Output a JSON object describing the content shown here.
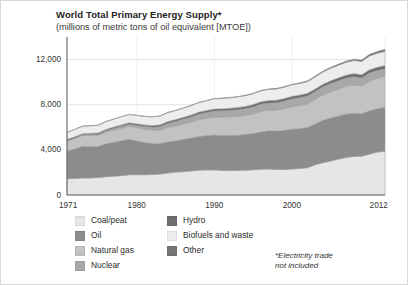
{
  "chart_data": {
    "type": "area",
    "stacked": true,
    "title": "World Total Primary Energy Supply*",
    "subtitle": "(millions of metric tons of oil equivalent [MTOE])",
    "xlabel": "",
    "ylabel": "",
    "grid": true,
    "legend_position": "below",
    "xlim": [
      1971,
      2012
    ],
    "ylim": [
      0,
      14000
    ],
    "yticks": [
      0,
      4000,
      8000,
      12000
    ],
    "ytick_labels": [
      "0",
      "4,000",
      "8,000",
      "12,000"
    ],
    "xticks": [
      1971,
      1980,
      1990,
      2000,
      2012
    ],
    "xtick_labels": [
      "1971",
      "1980",
      "1990",
      "2000",
      "2012"
    ],
    "x": [
      1971,
      1972,
      1973,
      1974,
      1975,
      1976,
      1977,
      1978,
      1979,
      1980,
      1981,
      1982,
      1983,
      1984,
      1985,
      1986,
      1987,
      1988,
      1989,
      1990,
      1991,
      1992,
      1993,
      1994,
      1995,
      1996,
      1997,
      1998,
      1999,
      2000,
      2001,
      2002,
      2003,
      2004,
      2005,
      2006,
      2007,
      2008,
      2009,
      2010,
      2011,
      2012
    ],
    "series": [
      {
        "name": "Coal/peat",
        "color": "#e6e6e6",
        "values": [
          1440,
          1470,
          1500,
          1510,
          1550,
          1620,
          1670,
          1710,
          1790,
          1800,
          1790,
          1810,
          1850,
          1950,
          2030,
          2070,
          2130,
          2190,
          2220,
          2220,
          2180,
          2160,
          2180,
          2190,
          2230,
          2280,
          2300,
          2270,
          2250,
          2300,
          2350,
          2420,
          2680,
          2860,
          3020,
          3180,
          3320,
          3420,
          3440,
          3620,
          3800,
          3880
        ]
      },
      {
        "name": "Oil",
        "color": "#8c8c8c",
        "values": [
          2450,
          2620,
          2810,
          2790,
          2740,
          2920,
          3010,
          3100,
          3140,
          3000,
          2860,
          2760,
          2720,
          2760,
          2760,
          2860,
          2910,
          3000,
          3050,
          3090,
          3090,
          3130,
          3120,
          3180,
          3230,
          3300,
          3390,
          3400,
          3480,
          3530,
          3540,
          3560,
          3630,
          3760,
          3810,
          3830,
          3860,
          3830,
          3760,
          3840,
          3850,
          3880
        ]
      },
      {
        "name": "Natural gas",
        "color": "#c2c2c2",
        "values": [
          890,
          930,
          970,
          990,
          990,
          1040,
          1070,
          1110,
          1170,
          1180,
          1190,
          1190,
          1200,
          1290,
          1330,
          1360,
          1430,
          1490,
          1550,
          1600,
          1640,
          1650,
          1680,
          1690,
          1740,
          1830,
          1830,
          1870,
          1920,
          2010,
          2050,
          2110,
          2180,
          2250,
          2330,
          2390,
          2470,
          2520,
          2470,
          2630,
          2700,
          2760
        ]
      },
      {
        "name": "Nuclear",
        "color": "#a8a8a8",
        "values": [
          29,
          38,
          48,
          64,
          87,
          105,
          137,
          158,
          166,
          186,
          222,
          244,
          283,
          340,
          390,
          415,
          442,
          480,
          490,
          526,
          546,
          556,
          580,
          590,
          608,
          633,
          628,
          637,
          668,
          676,
          687,
          692,
          687,
          714,
          722,
          728,
          709,
          712,
          703,
          719,
          674,
          642
        ]
      },
      {
        "name": "Hydro",
        "color": "#6e6e6e",
        "values": [
          104,
          109,
          110,
          118,
          122,
          124,
          128,
          135,
          141,
          148,
          150,
          154,
          163,
          169,
          172,
          177,
          180,
          185,
          186,
          184,
          189,
          191,
          199,
          202,
          209,
          215,
          218,
          222,
          225,
          225,
          224,
          224,
          226,
          238,
          246,
          254,
          263,
          277,
          283,
          296,
          300,
          315
        ]
      },
      {
        "name": "Biofuels and waste",
        "color": "#ededed",
        "values": [
          640,
          650,
          660,
          670,
          680,
          690,
          705,
          715,
          725,
          740,
          750,
          765,
          780,
          795,
          805,
          820,
          830,
          845,
          855,
          905,
          915,
          925,
          940,
          950,
          965,
          980,
          990,
          1000,
          1010,
          1020,
          1030,
          1040,
          1060,
          1080,
          1100,
          1120,
          1140,
          1160,
          1180,
          1210,
          1230,
          1250
        ]
      },
      {
        "name": "Other",
        "color": "#767676",
        "values": [
          4,
          5,
          5,
          6,
          7,
          8,
          9,
          10,
          11,
          12,
          13,
          14,
          16,
          18,
          20,
          22,
          24,
          26,
          28,
          30,
          32,
          34,
          36,
          38,
          41,
          44,
          47,
          50,
          54,
          58,
          62,
          67,
          72,
          79,
          87,
          96,
          107,
          120,
          133,
          152,
          172,
          194
        ]
      }
    ],
    "totals": [
      5557,
      5822,
      6103,
      6148,
      6176,
      6507,
      6729,
      6938,
      7143,
      7066,
      6975,
      6937,
      7012,
      7322,
      7507,
      7724,
      7946,
      8226,
      8379,
      8555,
      8592,
      8646,
      8735,
      8840,
      9023,
      9282,
      9403,
      9446,
      9607,
      9819,
      9943,
      10113,
      10533,
      10981,
      11315,
      11598,
      11869,
      12041,
      11969,
      12467,
      12726,
      12921
    ]
  },
  "legend": {
    "left_column": [
      {
        "label": "Coal/peat",
        "color": "#e6e6e6",
        "swatch_name": "legend-swatch-coal-peat"
      },
      {
        "label": "Oil",
        "color": "#8c8c8c",
        "swatch_name": "legend-swatch-oil"
      },
      {
        "label": "Natural gas",
        "color": "#c2c2c2",
        "swatch_name": "legend-swatch-natural-gas"
      },
      {
        "label": "Nuclear",
        "color": "#a8a8a8",
        "swatch_name": "legend-swatch-nuclear"
      }
    ],
    "right_column": [
      {
        "label": "Hydro",
        "color": "#6e6e6e",
        "swatch_name": "legend-swatch-hydro"
      },
      {
        "label": "Biofuels and waste",
        "color": "#ededed",
        "swatch_name": "legend-swatch-biofuels"
      },
      {
        "label": "Other",
        "color": "#767676",
        "swatch_name": "legend-swatch-other"
      }
    ]
  },
  "footnote": {
    "line1": "*Electricity trade",
    "line2": "not included"
  },
  "colors": {
    "axis": "#6b6b6b",
    "grid": "#e4e4e4",
    "text": "#2b2b2b",
    "background": "#ffffff",
    "band_outline": "#9a9a9a"
  }
}
